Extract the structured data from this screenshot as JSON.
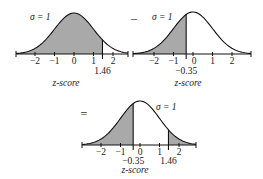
{
  "colors": {
    "fill": "#a9a9a9",
    "stroke": "#111111"
  },
  "operators": {
    "minus": "–",
    "equals": "="
  },
  "sigma_label": "σ = 1",
  "axis_label": "z-score",
  "chart_data": [
    {
      "type": "area",
      "title": "P(z < 1.46)",
      "distribution": "standard normal",
      "sigma": 1,
      "ticks": [
        "−2",
        "−1",
        "0",
        "1",
        "2"
      ],
      "marker_label": "1.46",
      "marker": 1.46,
      "shaded": "left of 1.46",
      "xlabel": "z-score"
    },
    {
      "type": "area",
      "title": "P(z < -0.35)",
      "distribution": "standard normal",
      "sigma": 1,
      "ticks": [
        "−2",
        "−1",
        "0",
        "1",
        "2"
      ],
      "marker_label": "−0.35",
      "marker": -0.35,
      "shaded": "left of -0.35",
      "xlabel": "z-score"
    },
    {
      "type": "area",
      "title": "Result",
      "distribution": "standard normal",
      "sigma": 1,
      "ticks": [
        "−2",
        "−1",
        "0",
        "1",
        "2"
      ],
      "markers": [
        -0.35,
        1.46
      ],
      "marker_labels": [
        "−0.35",
        "1.46"
      ],
      "shaded": "tails outside -0.35 and 1.46",
      "xlabel": "z-score"
    }
  ]
}
